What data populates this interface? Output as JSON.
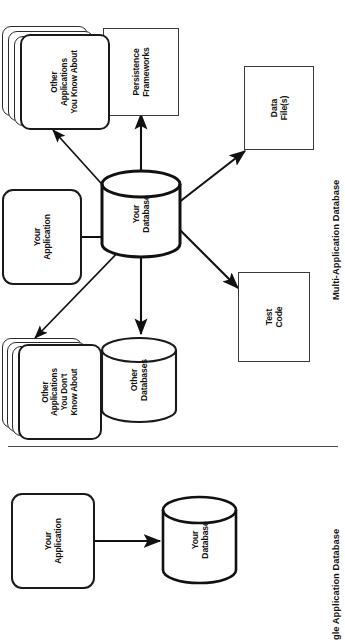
{
  "page": {
    "background": "#ffffff",
    "width": 345,
    "height": 637,
    "orientation": "rotated-90-ccw"
  },
  "colors": {
    "ink": "#111111",
    "stroke_heavy": "#1a1a1a",
    "stroke_light": "#3a3a3a",
    "divider": "#4a4a4a",
    "paper": "#ffffff"
  },
  "figures": [
    {
      "id": "multi-application-database",
      "caption": "Multi-Application Database",
      "nodes": [
        {
          "id": "other-apps-unknown",
          "label": "Other\nApplications\nYou Don't\nKnow About",
          "shape": "stacked-rounded-rect"
        },
        {
          "id": "your-application",
          "label": "Your\nApplication",
          "shape": "rounded-rect"
        },
        {
          "id": "other-apps-known",
          "label": "Other\nApplications\nYou Know About",
          "shape": "stacked-rounded-rect"
        },
        {
          "id": "other-databases",
          "label": "Other\nDatabases",
          "shape": "cylinder"
        },
        {
          "id": "your-database",
          "label": "Your\nDatabase",
          "shape": "cylinder"
        },
        {
          "id": "persistence-frameworks",
          "label": "Persistence\nFrameworks",
          "shape": "rect"
        },
        {
          "id": "test-code",
          "label": "Test\nCode",
          "shape": "rect"
        },
        {
          "id": "data-files",
          "label": "Data\nFile(s)",
          "shape": "rect"
        }
      ],
      "edges": [
        {
          "from": "your-database",
          "to": "other-apps-unknown",
          "arrow": "single"
        },
        {
          "from": "your-database",
          "to": "your-application",
          "arrow": "double"
        },
        {
          "from": "your-database",
          "to": "other-apps-known",
          "arrow": "single"
        },
        {
          "from": "your-database",
          "to": "other-databases",
          "arrow": "double"
        },
        {
          "from": "your-database",
          "to": "persistence-frameworks",
          "arrow": "double"
        },
        {
          "from": "your-database",
          "to": "test-code",
          "arrow": "double"
        },
        {
          "from": "your-database",
          "to": "data-files",
          "arrow": "double"
        }
      ]
    },
    {
      "id": "single-application-database",
      "caption": "gle Application Database",
      "caption_full": "Single Application Database",
      "caption_clipped": true,
      "nodes": [
        {
          "id": "your-application-single",
          "label": "Your\nApplication",
          "shape": "rounded-rect"
        },
        {
          "id": "your-database-single",
          "label": "Your\nDatabase",
          "shape": "cylinder"
        }
      ],
      "edges": [
        {
          "from": "your-application-single",
          "to": "your-database-single",
          "arrow": "double"
        }
      ]
    }
  ]
}
